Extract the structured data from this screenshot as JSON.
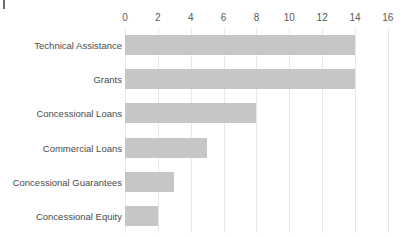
{
  "chart_data": {
    "type": "bar",
    "orientation": "horizontal",
    "title": "",
    "subtitle": "",
    "xlabel": "",
    "ylabel": "",
    "categories": [
      "Technical Assistance",
      "Grants",
      "Concessional Loans",
      "Commercial Loans",
      "Concessional Guarantees",
      "Concessional Equity"
    ],
    "values": [
      14,
      14,
      8,
      5,
      3,
      2
    ],
    "xlim": [
      0,
      16
    ],
    "xticks": [
      0,
      2,
      4,
      6,
      8,
      10,
      12,
      14,
      16
    ],
    "xtick_labels": [
      "0",
      "2",
      "4",
      "6",
      "8",
      "10",
      "12",
      "14",
      "16"
    ],
    "grid": "vertical",
    "legend": "none",
    "bar_color": "#c6c6c6",
    "gridline_color": "#e8e8e8",
    "background_color": "#ffffff",
    "text_color": "#4a4a4a"
  }
}
